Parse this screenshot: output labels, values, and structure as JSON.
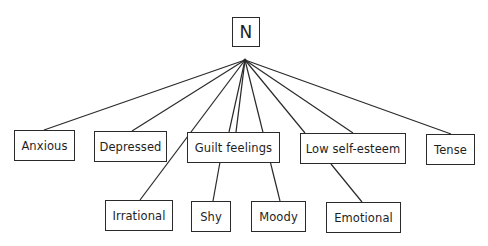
{
  "diagram": {
    "type": "tree",
    "root": {
      "id": "N",
      "label": "N"
    },
    "level1": [
      {
        "id": "anxious",
        "label": "Anxious"
      },
      {
        "id": "depressed",
        "label": "Depressed"
      },
      {
        "id": "guilt",
        "label": "Guilt feelings"
      },
      {
        "id": "selfesteem",
        "label": "Low self-esteem"
      },
      {
        "id": "tense",
        "label": "Tense"
      }
    ],
    "level2": [
      {
        "id": "irrational",
        "label": "Irrational"
      },
      {
        "id": "shy",
        "label": "Shy"
      },
      {
        "id": "moody",
        "label": "Moody"
      },
      {
        "id": "emotional",
        "label": "Emotional"
      }
    ],
    "edges": [
      [
        "N",
        "anxious"
      ],
      [
        "N",
        "depressed"
      ],
      [
        "N",
        "irrational"
      ],
      [
        "N",
        "guilt"
      ],
      [
        "N",
        "guilt"
      ],
      [
        "N",
        "moody"
      ],
      [
        "N",
        "selfesteem"
      ],
      [
        "N",
        "selfesteem"
      ],
      [
        "N",
        "tense"
      ],
      [
        "guilt",
        "shy"
      ],
      [
        "selfesteem",
        "emotional"
      ]
    ]
  }
}
